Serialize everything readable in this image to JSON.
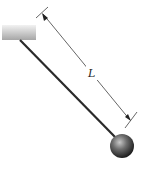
{
  "diagram": {
    "type": "simple-pendulum",
    "dimension_label": "L",
    "colors": {
      "ceiling_light": "#e8e8e8",
      "ceiling_dark": "#a9a9a9",
      "string": "#2a2a2a",
      "dimension_line": "#555555",
      "bob_highlight": "#bdbdbd",
      "bob_dark": "#2b2b2b"
    }
  }
}
